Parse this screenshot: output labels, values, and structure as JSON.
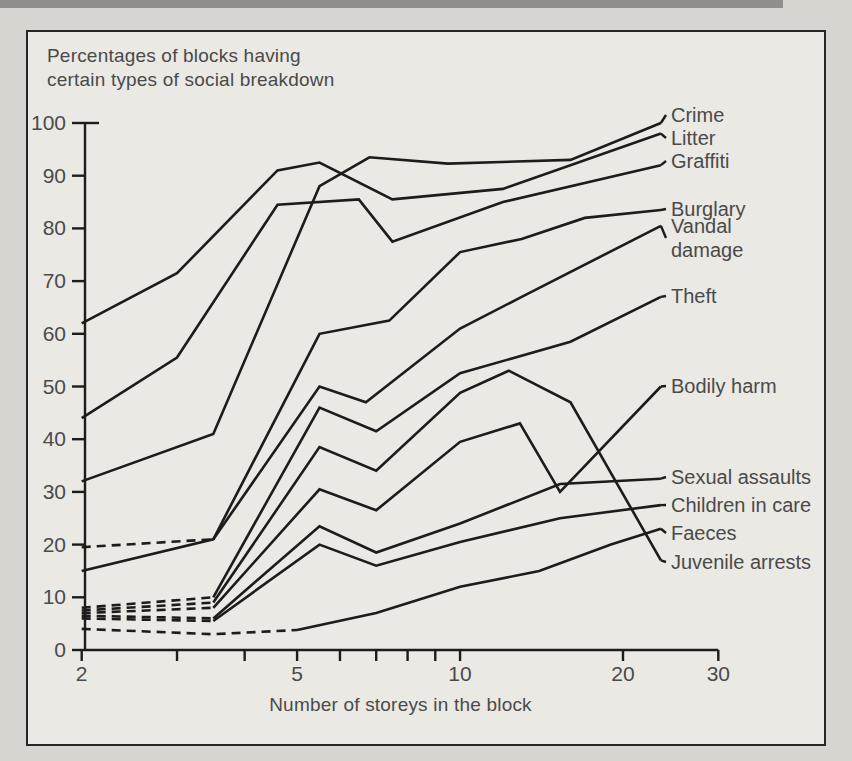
{
  "page": {
    "title_line1": "Percentages of blocks having",
    "title_line2": "certain types of social breakdown",
    "x_axis_title": "Number of storeys in the block"
  },
  "colors": {
    "line": "#1c1c1c",
    "text": "#4a4a4a",
    "tick_text": "#4a4a4a",
    "page_bg": "#d8d5d0",
    "panel_bg": "#ebe9e3",
    "border": "#262626",
    "top_strip": "#8f8e8b"
  },
  "chart_data": {
    "type": "line",
    "title": "Percentages of blocks having certain types of social breakdown",
    "xlabel": "Number of storeys in the block",
    "x_scale": "log",
    "xlim": [
      2,
      30
    ],
    "ylim": [
      0,
      100
    ],
    "grid": false,
    "legend_position": "right-edge-labels",
    "x_ticks": [
      2,
      3,
      4,
      5,
      6,
      7,
      8,
      9,
      10,
      20,
      30
    ],
    "x_labeled_ticks": [
      "2",
      "5",
      "10",
      "20",
      "30"
    ],
    "x_labeled_tick_values": [
      2,
      5,
      10,
      20,
      30
    ],
    "y_ticks": [
      "0",
      "10",
      "20",
      "30",
      "40",
      "50",
      "60",
      "70",
      "80",
      "90",
      "100"
    ],
    "y_tick_values": [
      0,
      10,
      20,
      30,
      40,
      50,
      60,
      70,
      80,
      90,
      100
    ],
    "note": "dash_until = storey value up to which the line is drawn dashed (uncertain data); 0 = fully solid",
    "series": [
      {
        "id": "crime",
        "name": "Crime",
        "label_lines": [
          "Crime"
        ],
        "label_y": 115,
        "dash_until": 0,
        "points": [
          [
            2,
            32
          ],
          [
            3.5,
            41
          ],
          [
            5.5,
            88
          ],
          [
            6.8,
            93.5
          ],
          [
            9.5,
            92.3
          ],
          [
            16,
            93
          ],
          [
            23.5,
            100
          ]
        ]
      },
      {
        "id": "litter",
        "name": "Litter",
        "label_lines": [
          "Litter"
        ],
        "label_y": 138,
        "dash_until": 0,
        "points": [
          [
            2,
            62
          ],
          [
            3,
            71.5
          ],
          [
            4.6,
            91
          ],
          [
            5.5,
            92.5
          ],
          [
            7.5,
            85.5
          ],
          [
            12,
            87.5
          ],
          [
            23.5,
            98
          ]
        ]
      },
      {
        "id": "graffiti",
        "name": "Graffiti",
        "label_lines": [
          "Graffiti"
        ],
        "label_y": 161,
        "dash_until": 0,
        "points": [
          [
            2,
            44
          ],
          [
            3,
            55.5
          ],
          [
            4.6,
            84.5
          ],
          [
            6.5,
            85.5
          ],
          [
            7.5,
            77.5
          ],
          [
            12,
            85
          ],
          [
            23.5,
            92
          ]
        ]
      },
      {
        "id": "burglary",
        "name": "Burglary",
        "label_lines": [
          "Burglary"
        ],
        "label_y": 209,
        "dash_until": 3.5,
        "points": [
          [
            2,
            19.5
          ],
          [
            3.5,
            21
          ],
          [
            5.5,
            60
          ],
          [
            7.4,
            62.5
          ],
          [
            10,
            75.5
          ],
          [
            13,
            78
          ],
          [
            17,
            82
          ],
          [
            23.5,
            83.5
          ]
        ]
      },
      {
        "id": "vandal-damage",
        "name": "Vandal damage",
        "label_lines": [
          "Vandal",
          "damage"
        ],
        "label_y": 238,
        "dash_until": 0,
        "points": [
          [
            2,
            15
          ],
          [
            3.5,
            21
          ],
          [
            5.5,
            50
          ],
          [
            6.7,
            47
          ],
          [
            10,
            61
          ],
          [
            13,
            67
          ],
          [
            23.5,
            80.5
          ]
        ]
      },
      {
        "id": "theft",
        "name": "Theft",
        "label_lines": [
          "Theft"
        ],
        "label_y": 296,
        "dash_until": 3.5,
        "points": [
          [
            2,
            8
          ],
          [
            3.5,
            10
          ],
          [
            5.5,
            46
          ],
          [
            7,
            41.5
          ],
          [
            10,
            52.5
          ],
          [
            16,
            58.5
          ],
          [
            23.5,
            67
          ]
        ]
      },
      {
        "id": "bodily-harm",
        "name": "Bodily harm",
        "label_lines": [
          "Bodily harm"
        ],
        "label_y": 386,
        "dash_until": 3.5,
        "points": [
          [
            2,
            7
          ],
          [
            3.5,
            8
          ],
          [
            5.5,
            30.5
          ],
          [
            7,
            26.5
          ],
          [
            10,
            39.5
          ],
          [
            12.9,
            43
          ],
          [
            15.3,
            30
          ],
          [
            23.5,
            50
          ]
        ]
      },
      {
        "id": "sexual-assaults",
        "name": "Sexual assaults",
        "label_lines": [
          "Sexual assaults"
        ],
        "label_y": 477,
        "dash_until": 3.5,
        "points": [
          [
            2,
            6.5
          ],
          [
            3.5,
            6
          ],
          [
            5.5,
            23.5
          ],
          [
            7,
            18.5
          ],
          [
            10,
            24
          ],
          [
            15.3,
            31.5
          ],
          [
            23.5,
            32.5
          ]
        ]
      },
      {
        "id": "children-in-care",
        "name": "Children in care",
        "label_lines": [
          "Children in care"
        ],
        "label_y": 505,
        "dash_until": 3.5,
        "points": [
          [
            2,
            6
          ],
          [
            3.5,
            5.5
          ],
          [
            5.5,
            20
          ],
          [
            7,
            16
          ],
          [
            10,
            20.5
          ],
          [
            15.3,
            25
          ],
          [
            23.5,
            27.5
          ]
        ]
      },
      {
        "id": "faeces",
        "name": "Faeces",
        "label_lines": [
          "Faeces"
        ],
        "label_y": 533,
        "dash_until": 5,
        "points": [
          [
            2,
            4
          ],
          [
            3.5,
            3
          ],
          [
            5,
            3.8
          ],
          [
            7,
            7
          ],
          [
            10,
            12
          ],
          [
            14,
            15
          ],
          [
            19,
            20
          ],
          [
            23.5,
            23
          ]
        ]
      },
      {
        "id": "juvenile-arrests",
        "name": "Juvenile arrests",
        "label_lines": [
          "Juvenile arrests"
        ],
        "label_y": 562,
        "dash_until": 3.5,
        "points": [
          [
            2,
            7.5
          ],
          [
            3.5,
            9
          ],
          [
            5.5,
            38.5
          ],
          [
            7,
            34
          ],
          [
            10,
            48.8
          ],
          [
            12.3,
            53
          ],
          [
            16,
            47
          ],
          [
            23.5,
            17
          ]
        ]
      }
    ]
  }
}
